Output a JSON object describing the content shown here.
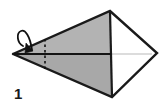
{
  "figure": {
    "kind": "origami-fold-step-diagram",
    "step_label": "1",
    "canvas": {
      "width": 166,
      "height": 104,
      "background": "#ffffff"
    }
  },
  "colors": {
    "background": "#ffffff",
    "paper_shaded": "#b3b3b3",
    "paper_shaded_lower": "#a8a8a8",
    "paper_white": "#ffffff",
    "outline": "#1a1a1a",
    "center_line": "#141414",
    "thin_guide_line": "#b9b9b9",
    "fold_dotted_line": "#111111",
    "arrow": "#111111",
    "step_text": "#1a1a1a"
  },
  "geometry": {
    "left_apex": {
      "x": 13,
      "y": 54
    },
    "top_vertex": {
      "x": 110,
      "y": 11
    },
    "bottom_vertex": {
      "x": 112,
      "y": 97
    },
    "right_vertex": {
      "x": 157,
      "y": 53
    },
    "spine_top": {
      "x": 110,
      "y": 11
    },
    "spine_bottom": {
      "x": 112,
      "y": 97
    }
  },
  "shapes": {
    "upper_shaded_panel": {
      "name": "upper-shaded-panel",
      "points": "13,54 110,11 110,53",
      "fill": "#b3b3b3"
    },
    "lower_shaded_panel": {
      "name": "lower-shaded-panel",
      "points": "13,54 111,55 112,97",
      "fill": "#a8a8a8"
    },
    "right_white_upper_panel": {
      "name": "right-white-upper-panel",
      "points": "110,11 157,53 110,53",
      "fill": "#ffffff"
    },
    "right_white_lower_panel": {
      "name": "right-white-lower-panel",
      "points": "111,55 157,53 112,97",
      "fill": "#ffffff"
    }
  },
  "lines": {
    "outer_outline": {
      "name": "outer-kite-outline",
      "points": "13,54 110,11 157,53 112,97 13,54",
      "stroke": "#1a1a1a",
      "width": 2.4
    },
    "vertical_spine": {
      "name": "vertical-spine-edge",
      "x1": 110,
      "y1": 11,
      "x2": 112,
      "y2": 97,
      "stroke": "#1a1a1a",
      "width": 2.2
    },
    "horizontal_center_line": {
      "name": "horizontal-center-fold-line",
      "x1": 13,
      "y1": 54,
      "x2": 111,
      "y2": 54,
      "stroke": "#141414",
      "width": 2.0
    },
    "right_thin_guide": {
      "name": "right-thin-guide-line",
      "x1": 112,
      "y1": 54,
      "x2": 152,
      "y2": 54,
      "stroke": "#b9b9b9",
      "width": 1.0
    },
    "dotted_fold_line": {
      "name": "dotted-fold-line",
      "x1": 45,
      "y1": 39,
      "x2": 45,
      "y2": 69,
      "stroke": "#111111",
      "width": 1.6,
      "dash": "2.5 3"
    }
  },
  "arrow": {
    "name": "fold-direction-arrow",
    "description": "curved hook arrow indicating fold toward the left",
    "curve_path": "M 32,50 C 30,36 25,29 21,31 C 16,33 17,43 23,46",
    "head_points": "32,50 27,44 25,52",
    "stroke": "#111111",
    "width": 1.8
  }
}
